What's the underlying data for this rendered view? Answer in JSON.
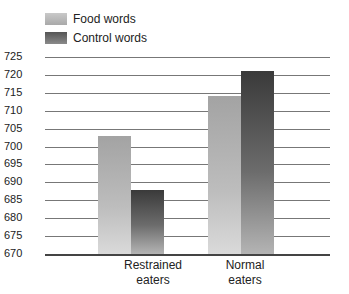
{
  "chart_data": {
    "type": "bar",
    "title": "",
    "xlabel": "",
    "ylabel": "",
    "categories": [
      "Restrained eaters",
      "Normal eaters"
    ],
    "series": [
      {
        "name": "Food words",
        "values": [
          703,
          714
        ],
        "color": "#b5b5b5"
      },
      {
        "name": "Control words",
        "values": [
          688,
          721
        ],
        "color": "#555555"
      }
    ],
    "ylim": [
      670,
      725
    ],
    "yticks": [
      725,
      720,
      715,
      710,
      705,
      700,
      695,
      690,
      685,
      680,
      675,
      670
    ],
    "grid": true,
    "legend_position": "top-left"
  },
  "legend": {
    "food": "Food words",
    "control": "Control words"
  },
  "axis": {
    "ticks": [
      "725",
      "720",
      "715",
      "710",
      "705",
      "700",
      "695",
      "690",
      "685",
      "680",
      "675",
      "670"
    ]
  },
  "categories": {
    "c0_line1": "Restrained",
    "c0_line2": "eaters",
    "c1_line1": "Normal",
    "c1_line2": "eaters"
  }
}
